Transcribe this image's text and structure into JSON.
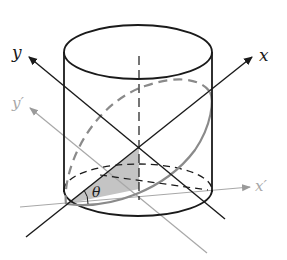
{
  "diagram": {
    "labels": {
      "x": "x",
      "y": "y",
      "x_prime": "x′",
      "y_prime": "y′",
      "theta": "θ"
    },
    "colors": {
      "ink": "#1a1a1a",
      "gray_axis": "#9a9a9a",
      "dashed_ellipse": "#8a8a8a",
      "shade": "#c4c4c4"
    }
  }
}
